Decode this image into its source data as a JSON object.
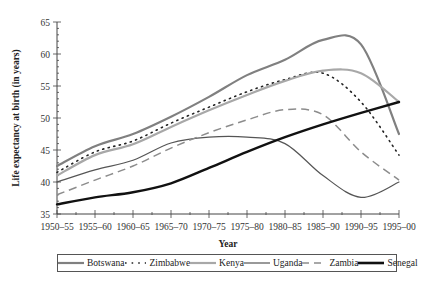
{
  "chart_data": {
    "type": "line",
    "title": "",
    "xlabel": "Year",
    "ylabel": "Life expectancy at birth (in years)",
    "ylim": [
      35,
      65
    ],
    "yticks": [
      35,
      40,
      45,
      50,
      55,
      60,
      65
    ],
    "grid": false,
    "legend_position": "bottom",
    "categories": [
      "1950–55",
      "1955–60",
      "1960–65",
      "1965–70",
      "1970–75",
      "1975–80",
      "1980–85",
      "1985–90",
      "1990–95",
      "1995–00"
    ],
    "series": [
      {
        "name": "Botswana",
        "style": "solid",
        "color": "#808080",
        "width": 2.2,
        "values": [
          42.5,
          45.6,
          47.5,
          50.2,
          53.3,
          56.7,
          59.1,
          62.2,
          61.5,
          47.5
        ]
      },
      {
        "name": "Zimbabwe",
        "style": "dotted",
        "color": "#222222",
        "width": 1.6,
        "values": [
          41.5,
          44.7,
          46.4,
          49.2,
          51.7,
          54.1,
          56.0,
          57.0,
          52.5,
          44.2
        ]
      },
      {
        "name": "Kenya",
        "style": "solid",
        "color": "#a8a8a8",
        "width": 2.2,
        "values": [
          41.0,
          44.2,
          45.9,
          48.6,
          51.2,
          53.6,
          55.8,
          57.4,
          57.0,
          52.5
        ]
      },
      {
        "name": "Uganda",
        "style": "solid",
        "color": "#555555",
        "width": 1.2,
        "values": [
          40.0,
          41.9,
          43.4,
          46.1,
          47.0,
          47.0,
          46.0,
          41.0,
          37.6,
          40.0
        ]
      },
      {
        "name": "Zambia",
        "style": "dashed",
        "color": "#8c8c8c",
        "width": 1.5,
        "values": [
          38.0,
          40.3,
          42.5,
          45.3,
          47.7,
          49.7,
          51.3,
          50.5,
          44.7,
          40.3
        ]
      },
      {
        "name": "Senegal",
        "style": "solid",
        "color": "#111111",
        "width": 2.4,
        "values": [
          36.5,
          37.6,
          38.4,
          39.8,
          42.2,
          44.7,
          47.0,
          49.0,
          50.8,
          52.5
        ]
      }
    ]
  },
  "legend": {
    "items": [
      {
        "label": "Botswana"
      },
      {
        "label": "Zimbabwe"
      },
      {
        "label": "Kenya"
      },
      {
        "label": "Uganda"
      },
      {
        "label": "Zambia"
      },
      {
        "label": "Senegal"
      }
    ]
  }
}
